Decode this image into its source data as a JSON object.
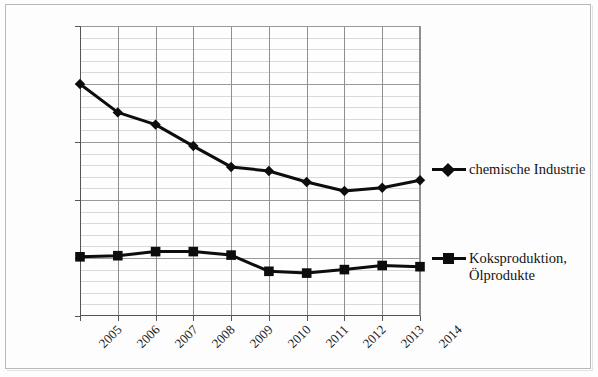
{
  "chart_data": {
    "type": "line",
    "title": "",
    "subtitle": "",
    "xlabel": "",
    "ylabel": "",
    "categories": [
      "2005",
      "2006",
      "2007",
      "2008",
      "2009",
      "2010",
      "2011",
      "2012",
      "2013",
      "2014"
    ],
    "series": [
      {
        "name": "chemische Industrie",
        "marker": "diamond",
        "color": "#0d0d0d",
        "values": [
          20000,
          17550,
          16500,
          14650,
          12850,
          12500,
          11550,
          10780,
          11050,
          11700
        ]
      },
      {
        "name": "Koksproduktion,\nÖlprodukte",
        "marker": "square",
        "color": "#0d0d0d",
        "values": [
          5100,
          5200,
          5550,
          5550,
          5250,
          3850,
          3700,
          4000,
          4350,
          4250
        ]
      }
    ],
    "ylim": [
      0,
      25000
    ],
    "ytick_values": [
      0,
      5000,
      10000,
      15000,
      20000,
      25000
    ],
    "ytick_labels": [
      "0",
      "5.000",
      "10.000",
      "15.000",
      "20.000",
      "25.000"
    ],
    "minor_tick_step": 1000,
    "grid": true,
    "legend_position": "right",
    "legend": [
      {
        "label": "chemische Industrie",
        "marker": "diamond"
      },
      {
        "label": "Koksproduktion,\nÖlprodukte",
        "marker": "square"
      }
    ]
  }
}
